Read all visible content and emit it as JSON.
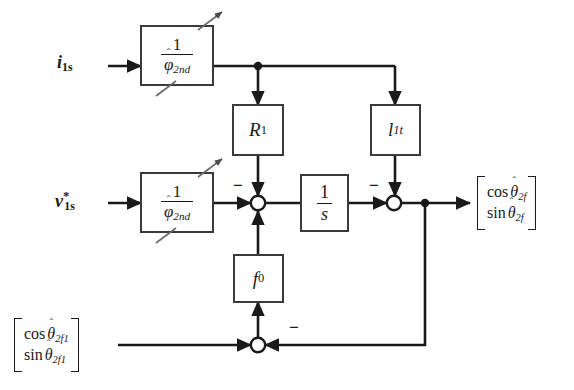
{
  "diagram": {
    "stroke_color": "#1a1a1a",
    "background": "#ffffff",
    "inputs": [
      {
        "name": "current-input",
        "label_main": "i",
        "label_sub": "1s",
        "label_sup": ""
      },
      {
        "name": "voltage-command-input",
        "label_main": "v",
        "label_sub": "1s",
        "label_sup": "*"
      }
    ],
    "blocks": [
      {
        "name": "gain-block-top",
        "id": "phi_top",
        "num": "1",
        "den_main": "φ",
        "den_sub": "2nd",
        "hat": true,
        "adjustable": true
      },
      {
        "name": "gain-block-bottom",
        "id": "phi_bot",
        "num": "1",
        "den_main": "φ",
        "den_sub": "2nd",
        "hat": true,
        "adjustable": true
      },
      {
        "name": "resistance-block",
        "id": "R1",
        "main": "R",
        "sub": "1",
        "adjustable": false
      },
      {
        "name": "leakage-block",
        "id": "l1t",
        "main": "l",
        "sub": "1t",
        "adjustable": false
      },
      {
        "name": "integrator-block",
        "id": "int",
        "num": "1",
        "den_main": "s",
        "den_sub": "",
        "adjustable": false
      },
      {
        "name": "feedback-gain-block",
        "id": "f0",
        "main": "f",
        "sub": "0",
        "adjustable": false
      }
    ],
    "sum_junctions": [
      {
        "name": "sum-junction-1",
        "signs": [
          "-",
          "+",
          "+"
        ]
      },
      {
        "name": "sum-junction-2",
        "signs": [
          "-",
          "+"
        ]
      },
      {
        "name": "sum-junction-3",
        "signs": [
          "+",
          "-"
        ]
      }
    ],
    "sign_marks": [
      {
        "name": "minus-sign-r1",
        "text": "−"
      },
      {
        "name": "minus-sign-l1t",
        "text": "−"
      },
      {
        "name": "minus-sign-fb",
        "text": "−"
      }
    ],
    "outputs": [
      {
        "name": "output-vector",
        "rows": [
          {
            "fn": "cos",
            "var": "θ",
            "sub": "2f",
            "hat": true
          },
          {
            "fn": "sin",
            "var": "θ",
            "sub": "2f",
            "hat": true
          }
        ]
      }
    ],
    "feedback_source": {
      "name": "reference-angle-vector",
      "rows": [
        {
          "fn": "cos",
          "var": "θ",
          "sub": "2f1",
          "hat": true
        },
        {
          "fn": "sin",
          "var": "θ",
          "sub": "2f1",
          "hat": true
        }
      ]
    }
  }
}
